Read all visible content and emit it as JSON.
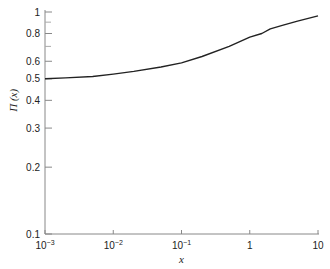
{
  "chart_data": {
    "type": "line",
    "title": "",
    "xlabel": "x",
    "ylabel": "Π (x)",
    "xscale": "log",
    "yscale": "log",
    "xlim": [
      0.001,
      10
    ],
    "ylim": [
      0.1,
      1
    ],
    "grid": false,
    "legend": null,
    "x_ticks": [
      {
        "value": 0.001,
        "base": "10",
        "exp": "−3"
      },
      {
        "value": 0.01,
        "base": "10",
        "exp": "−2"
      },
      {
        "value": 0.1,
        "base": "10",
        "exp": "−1"
      },
      {
        "value": 1,
        "base": "1",
        "exp": ""
      },
      {
        "value": 10,
        "base": "10",
        "exp": ""
      }
    ],
    "y_ticks": [
      {
        "value": 1,
        "label": "1"
      },
      {
        "value": 0.8,
        "label": "0.8"
      },
      {
        "value": 0.6,
        "label": "0.6"
      },
      {
        "value": 0.5,
        "label": "0.5"
      },
      {
        "value": 0.4,
        "label": "0.4"
      },
      {
        "value": 0.3,
        "label": "0.3"
      },
      {
        "value": 0.2,
        "label": "0.2"
      },
      {
        "value": 0.1,
        "label": "0.1"
      }
    ],
    "y_minor_ticks": [
      0.9,
      0.7
    ],
    "series": [
      {
        "name": "Π(x)",
        "x": [
          0.001,
          0.002,
          0.005,
          0.01,
          0.02,
          0.05,
          0.1,
          0.2,
          0.5,
          1,
          1.5,
          2,
          3,
          5,
          10
        ],
        "y": [
          0.5,
          0.505,
          0.512,
          0.525,
          0.54,
          0.565,
          0.59,
          0.63,
          0.7,
          0.77,
          0.8,
          0.84,
          0.87,
          0.91,
          0.96
        ]
      }
    ]
  }
}
